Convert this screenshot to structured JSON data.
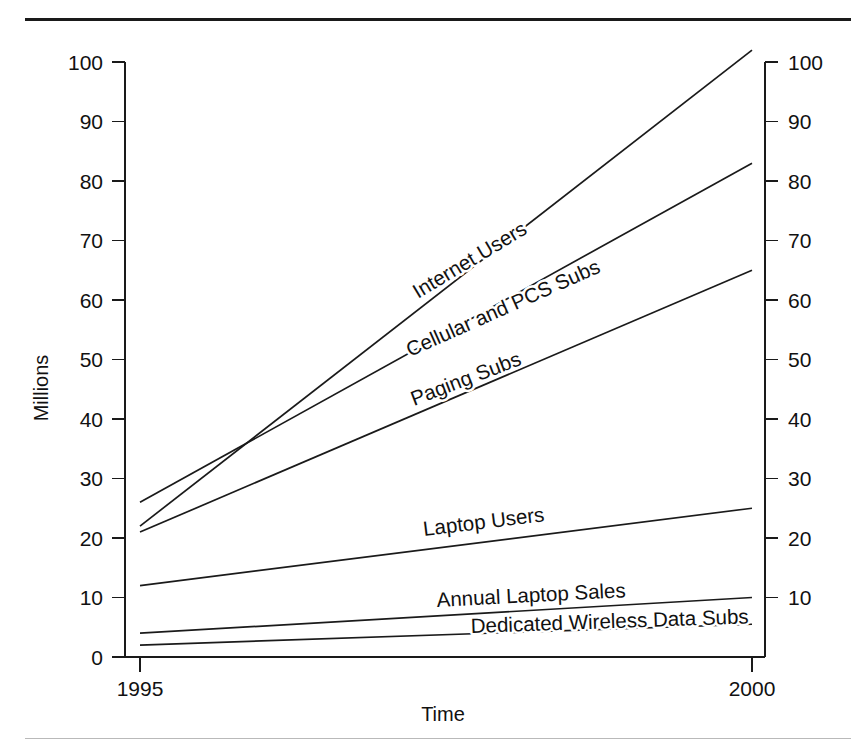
{
  "figure": {
    "kind": "line-chart",
    "frame_rule_color": "#1a1a1a",
    "line_color": "#1a1a1a",
    "background": "#ffffff"
  },
  "axes": {
    "y_title": "Millions",
    "x_title": "Time",
    "y_ticks_left": [
      "0",
      "10",
      "20",
      "30",
      "40",
      "50",
      "60",
      "70",
      "80",
      "90",
      "100"
    ],
    "y_ticks_right": [
      "10",
      "20",
      "30",
      "40",
      "50",
      "60",
      "70",
      "80",
      "90",
      "100"
    ],
    "x_ticks": [
      "1995",
      "2000"
    ]
  },
  "chart_data": {
    "type": "line",
    "title": "",
    "subtitle": "",
    "xlabel": "Time",
    "ylabel": "Millions",
    "x": [
      1995,
      2000
    ],
    "xlim": [
      1995,
      2000
    ],
    "ylim": [
      0,
      100
    ],
    "y_ticks": [
      0,
      10,
      20,
      30,
      40,
      50,
      60,
      70,
      80,
      90,
      100
    ],
    "x_ticks": [
      1995,
      2000
    ],
    "grid": false,
    "legend": "inline-labels-on-lines",
    "dual_y_axis": true,
    "units": "Millions",
    "series": [
      {
        "name": "Internet Users",
        "values": [
          22,
          102
        ],
        "label_rotation": -31
      },
      {
        "name": "Cellular and PCS Subs",
        "values": [
          26,
          83
        ],
        "label_rotation": -24
      },
      {
        "name": "Paging Subs",
        "values": [
          21,
          65
        ],
        "label_rotation": -21
      },
      {
        "name": "Laptop Users",
        "values": [
          12,
          25
        ],
        "label_rotation": -7
      },
      {
        "name": "Annual Laptop Sales",
        "values": [
          4,
          10
        ],
        "label_rotation": -3
      },
      {
        "name": "Dedicated Wireless Data Subs",
        "values": [
          2,
          5.5
        ],
        "label_rotation": -2
      }
    ]
  },
  "series_labels": [
    {
      "text": "Internet Users",
      "x": 418,
      "y": 299,
      "rotate": -31
    },
    {
      "text": "Cellular and PCS Subs",
      "x": 410,
      "y": 357,
      "rotate": -24
    },
    {
      "text": "Paging Subs",
      "x": 414,
      "y": 406,
      "rotate": -21
    },
    {
      "text": "Laptop Users",
      "x": 424,
      "y": 536,
      "rotate": -7
    },
    {
      "text": "Annual Laptop Sales",
      "x": 437,
      "y": 607,
      "rotate": -3
    },
    {
      "text": "Dedicated Wireless Data Subs",
      "x": 471,
      "y": 633,
      "rotate": -2
    }
  ]
}
